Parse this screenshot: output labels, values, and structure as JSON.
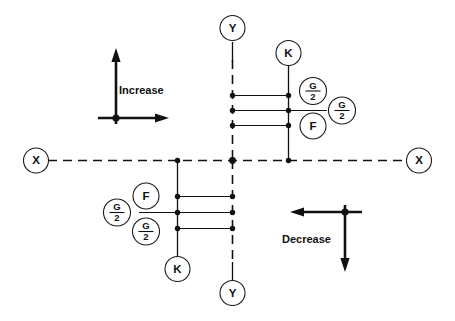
{
  "diagram": {
    "background_color": "#ffffff",
    "line_color": "#111111",
    "axes": {
      "x_left_label": "X",
      "x_right_label": "X",
      "y_top_label": "Y",
      "y_bottom_label": "Y",
      "style": "dashed"
    },
    "indicators": [
      {
        "name": "increase",
        "label": "Increase",
        "arrow_vertical": "up",
        "arrow_horizontal": "right"
      },
      {
        "name": "decrease",
        "label": "Decrease",
        "arrow_vertical": "down",
        "arrow_horizontal": "left"
      }
    ],
    "upper_right_group": {
      "stem_label": "K",
      "callouts": [
        {
          "label_num": "G",
          "label_den": "2",
          "kind": "fraction",
          "row": 1
        },
        {
          "label_num": "G",
          "label_den": "2",
          "kind": "fraction",
          "row": 2
        },
        {
          "label": "F",
          "kind": "letter",
          "row": 3
        }
      ]
    },
    "lower_left_group": {
      "stem_label": "K",
      "callouts": [
        {
          "label": "F",
          "kind": "letter",
          "row": 1
        },
        {
          "label_num": "G",
          "label_den": "2",
          "kind": "fraction",
          "row": 2
        },
        {
          "label_num": "G",
          "label_den": "2",
          "kind": "fraction",
          "row": 3
        }
      ]
    }
  }
}
